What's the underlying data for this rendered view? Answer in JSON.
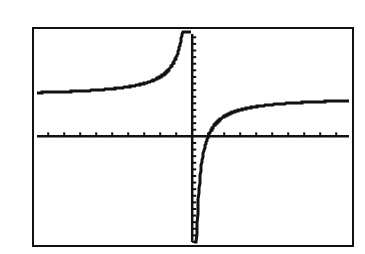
{
  "chart_data": {
    "type": "line",
    "title": "",
    "xlabel": "",
    "ylabel": "",
    "function": "y = 6 - 6/x",
    "xlim": [
      -9.7,
      9.8
    ],
    "ylim": [
      -16,
      15.5
    ],
    "x_tick_step": 1,
    "y_tick_step": 1,
    "grid": false,
    "legend": null,
    "vertical_asymptote": 0,
    "horizontal_asymptote": 6,
    "x_intercept": 1,
    "series": [
      {
        "name": "f(x)",
        "x": [
          -9.7,
          -8,
          -6,
          -4,
          -3,
          -2,
          -1.5,
          -1,
          -0.7,
          -0.5,
          -0.4,
          0.4,
          0.5,
          0.7,
          0.8,
          1,
          1.5,
          2,
          3,
          4,
          6,
          8,
          9.8
        ],
        "values": [
          6.62,
          6.75,
          7,
          7.5,
          8,
          9,
          10,
          12,
          14.57,
          18,
          21,
          -9,
          -6,
          -2.57,
          -1.5,
          0,
          2,
          3,
          4,
          4.5,
          5,
          5.25,
          5.39
        ]
      }
    ],
    "colors": {
      "plot": "#111111",
      "frame": "#111111",
      "background": "#ffffff"
    }
  },
  "screen": {
    "label": "Graphing calculator window"
  }
}
